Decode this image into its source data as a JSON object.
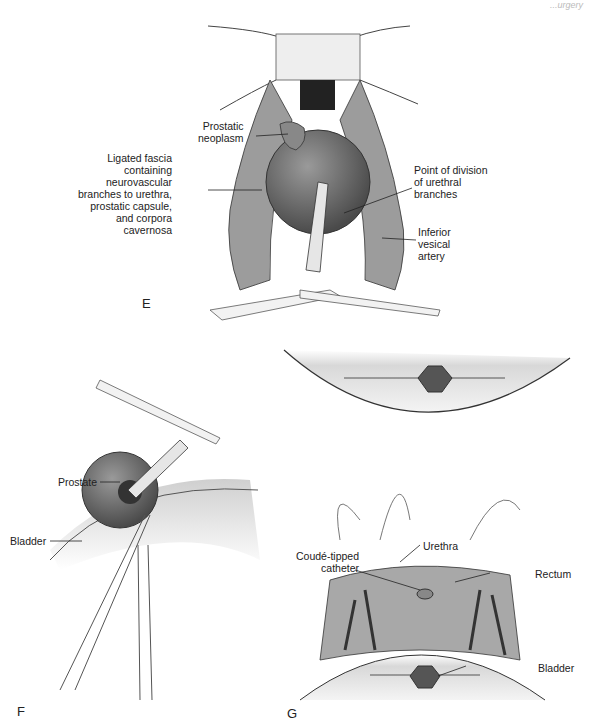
{
  "header": {
    "running_title": "...urgery"
  },
  "panels": {
    "E": {
      "letter": "E",
      "labels": {
        "prostatic_neoplasm": "Prostatic\nneoplasm",
        "ligated_fascia": "Ligated fascia\ncontaining\nneurovascular\nbranches to urethra,\nprostatic capsule,\nand corpora\ncavernosa",
        "point_of_division": "Point of division\nof urethral\nbranches",
        "inferior_vesical": "Inferior\nvesical\nartery"
      }
    },
    "F": {
      "letter": "F",
      "labels": {
        "prostate": "Prostate",
        "bladder": "Bladder"
      }
    },
    "G": {
      "letter": "G",
      "labels": {
        "urethra": "Urethra",
        "coude_catheter": "Coudé-tipped\ncatheter",
        "rectum": "Rectum",
        "bladder": "Bladder"
      }
    }
  },
  "colors": {
    "tissue_dark": "#555555",
    "tissue_mid": "#8a8a8a",
    "tissue_light": "#d6d6d6",
    "line": "#333333"
  }
}
